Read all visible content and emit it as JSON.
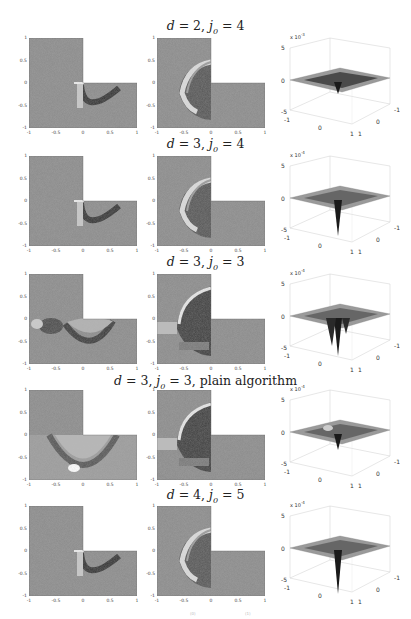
{
  "figure": {
    "rows": [
      {
        "title_html": "d = 2, j₀ = 4",
        "title_d": "2",
        "title_j": "4",
        "suffix": "",
        "exponent": "-3",
        "z_ticks": [
          "5",
          "0",
          "-5"
        ],
        "y_ticks_2d_mid": [
          "1",
          "0.5",
          "0",
          "-0.5",
          "-1"
        ],
        "variant": "a"
      },
      {
        "title_html": "d = 3, j₀ = 4",
        "title_d": "3",
        "title_j": "4",
        "suffix": "",
        "exponent": "-4",
        "z_ticks": [
          "5",
          "0",
          "-5"
        ],
        "y_ticks_2d_mid": [
          "1",
          "0.5",
          "0",
          "-0.5",
          "-1"
        ],
        "variant": "b"
      },
      {
        "title_html": "d = 3, j₀ = 3",
        "title_d": "3",
        "title_j": "3",
        "suffix": "",
        "exponent": "-4",
        "z_ticks": [
          "5",
          "0",
          "-5"
        ],
        "y_ticks_2d_mid": [
          "1",
          "0.5",
          "0",
          "-0.5",
          "-1"
        ],
        "variant": "c"
      },
      {
        "title_html": "d = 3, j₀ = 3, plain algorithm",
        "title_d": "3",
        "title_j": "3",
        "suffix": ", plain algorithm",
        "exponent": "-4",
        "z_ticks": [
          "5",
          "0",
          "-5"
        ],
        "y_ticks_2d_mid": [
          "1",
          "0.5",
          "0",
          "-0.5",
          "-1"
        ],
        "variant": "d"
      },
      {
        "title_html": "d = 4, j₀ = 5",
        "title_d": "4",
        "title_j": "5",
        "suffix": "",
        "exponent": "-4",
        "z_ticks": [
          "5",
          "0",
          "-5"
        ],
        "y_ticks_2d_mid": [
          "1",
          "0.5",
          "0",
          "-0.5",
          "-1"
        ],
        "variant": "e"
      }
    ],
    "axis_2d": {
      "x_ticks": [
        "-1",
        "-0.5",
        "0",
        "0.5",
        "1"
      ],
      "y_ticks": [
        "1",
        "0.5",
        "0",
        "-0.5",
        "-1"
      ]
    },
    "axis_3d": {
      "x_ticks": [
        "-1",
        "0",
        "1"
      ],
      "y_ticks": [
        "-1",
        "0",
        "1"
      ],
      "z_prefix": "x 10"
    },
    "footer_marks": [
      "(0)",
      "(1)"
    ]
  }
}
